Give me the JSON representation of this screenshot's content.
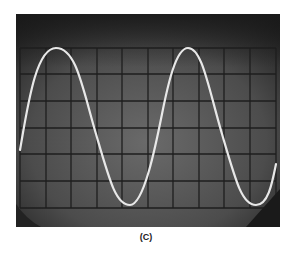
{
  "figure": {
    "caption": "(C)",
    "colors": {
      "screen_dark": "#2a2a2a",
      "screen_mid": "#5a5a5a",
      "grid": "#1e1e1e",
      "trace": "#e8e8e8"
    },
    "graticule": {
      "columns": 10,
      "rows": 8
    },
    "trace": {
      "waveform": "sine",
      "cycles_visible": 2
    }
  }
}
